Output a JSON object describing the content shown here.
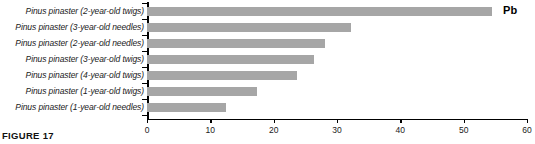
{
  "chart_data": {
    "type": "bar",
    "orientation": "horizontal",
    "title": "",
    "subtitle": "",
    "xlabel": "",
    "ylabel": "",
    "xlim": [
      0,
      60
    ],
    "xticks": [
      0,
      10,
      20,
      30,
      40,
      50,
      60
    ],
    "xtick_labels": [
      "0",
      "10",
      "20",
      "30",
      "40",
      "50",
      "60"
    ],
    "grid": false,
    "legend": "none",
    "annotation": "Pb",
    "series_name": "Pb",
    "bar_color": "#a6a6a6",
    "axis_color": "#000000",
    "categories": [
      "Pinus pinaster (2-year-old twigs)",
      "Pinus pinaster (3-year-old needles)",
      "Pinus pinaster (2-year-old needles)",
      "Pinus pinaster (3-year-old twigs)",
      "Pinus pinaster (4-year-old twigs)",
      "Pinus pinaster (1-year-old twigs)",
      "Pinus pinaster (1-year-old needles)"
    ],
    "values": [
      54.5,
      32.2,
      28.1,
      26.4,
      23.7,
      17.3,
      12.5
    ]
  },
  "caption": {
    "text": "FIGURE 17"
  }
}
